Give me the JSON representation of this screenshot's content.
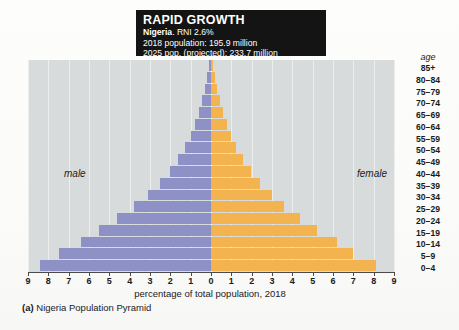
{
  "titlebox": {
    "heading": "RAPID GROWTH",
    "country": "Nigeria",
    "rni": ". RNI 2.6%",
    "pop2018": "2018 population: 195.9 million",
    "pop2025": "2025 pop. (projected): 233.7 million"
  },
  "labels": {
    "male": "male",
    "female": "female",
    "age_header": "age",
    "xtitle": "percentage of total population, 2018",
    "caption_prefix": "(a)",
    "caption": "Nigeria Population Pyramid"
  },
  "colors": {
    "male_bar": "#8d91c5",
    "female_bar": "#f3b44f",
    "plot_background": "#d8dbdb",
    "gridline": "#eceeee",
    "titlebox_background": "#141414",
    "axis": "#4a4a4a"
  },
  "chart_data": {
    "type": "bar",
    "subtype": "population-pyramid",
    "title": "RAPID GROWTH",
    "subtitle": "Nigeria. RNI 2.6%",
    "xlabel": "percentage of total population, 2018",
    "ylabel": "age",
    "xlim": [
      0,
      9
    ],
    "xticks": [
      9,
      8,
      7,
      6,
      5,
      4,
      3,
      2,
      1,
      0,
      1,
      2,
      3,
      4,
      5,
      6,
      7,
      8,
      9
    ],
    "grid": true,
    "legend_position": "inline",
    "categories": [
      "85+",
      "80–84",
      "75–79",
      "70–74",
      "65–69",
      "60–64",
      "55–59",
      "50–54",
      "45–49",
      "40–44",
      "35–39",
      "30–34",
      "25–29",
      "20–24",
      "15–19",
      "10–14",
      "5–9",
      "0–4"
    ],
    "series": [
      {
        "name": "male",
        "side": "left",
        "color": "#8d91c5",
        "values": [
          0.1,
          0.2,
          0.3,
          0.45,
          0.6,
          0.8,
          1.0,
          1.3,
          1.6,
          2.0,
          2.5,
          3.1,
          3.8,
          4.6,
          5.5,
          6.4,
          7.5,
          8.4
        ]
      },
      {
        "name": "female",
        "side": "right",
        "color": "#f3b44f",
        "values": [
          0.1,
          0.2,
          0.3,
          0.45,
          0.6,
          0.8,
          1.0,
          1.25,
          1.55,
          1.95,
          2.4,
          3.0,
          3.6,
          4.4,
          5.2,
          6.2,
          7.0,
          8.1
        ]
      }
    ]
  }
}
